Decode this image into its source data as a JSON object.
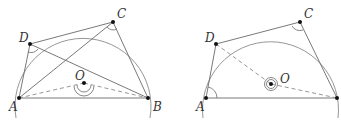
{
  "figures": [
    {
      "id": "left",
      "labels": {
        "A": "A",
        "B": "B",
        "C": "C",
        "D": "D",
        "O": "O"
      },
      "points": {
        "A": [
          19,
          98
        ],
        "B": [
          148,
          98
        ],
        "C": [
          113,
          22
        ],
        "D": [
          30,
          44
        ],
        "O": [
          84,
          83
        ]
      },
      "solid_segments": [
        "AB",
        "BC",
        "CD",
        "DA",
        "AC",
        "DB"
      ],
      "dashed_segments": [
        "AO",
        "OB"
      ],
      "angle_marks": [
        "D (ADB)",
        "C (ACB)",
        "O (double arc, AOB)"
      ]
    },
    {
      "id": "right",
      "labels": {
        "A": "A",
        "C": "C",
        "D": "D",
        "O": "O"
      },
      "points": {
        "A": [
          206,
          98
        ],
        "B": [
          337,
          98
        ],
        "C": [
          300,
          22
        ],
        "D": [
          216,
          44
        ],
        "O": [
          271,
          84
        ]
      },
      "solid_segments": [
        "AB",
        "BC",
        "CD",
        "DA"
      ],
      "dashed_segments": [
        "DO",
        "OB"
      ],
      "angle_marks": [
        "A (DAB)",
        "C (DCB)",
        "O (triple circle, reflex DOB)"
      ]
    }
  ]
}
